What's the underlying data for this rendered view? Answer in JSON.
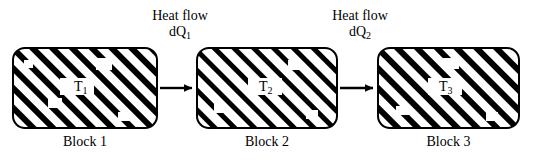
{
  "figure": {
    "type": "diagram",
    "background_color": "#ffffff",
    "stroke_color": "#000000"
  },
  "blocks": [
    {
      "id": "block1",
      "caption": "Block 1",
      "temperature_label": "T",
      "temperature_subscript": "1",
      "fill": "diagonal-hatch",
      "x": 13,
      "y": 48,
      "width": 144,
      "height": 80,
      "radius": 12
    },
    {
      "id": "block2",
      "caption": "Block 2",
      "temperature_label": "T",
      "temperature_subscript": "2",
      "fill": "diagonal-hatch",
      "x": 197,
      "y": 48,
      "width": 140,
      "height": 80,
      "radius": 12
    },
    {
      "id": "block3",
      "caption": "Block 3",
      "temperature_label": "T",
      "temperature_subscript": "3",
      "fill": "diagonal-hatch",
      "x": 378,
      "y": 48,
      "width": 141,
      "height": 80,
      "radius": 12
    }
  ],
  "arrows": [
    {
      "id": "arrow1",
      "from_block": "block1",
      "to_block": "block2",
      "label_line1": "Heat flow",
      "label_line2_prefix": "dQ",
      "label_line2_subscript": "1",
      "x1": 160,
      "x2": 196,
      "y": 88
    },
    {
      "id": "arrow2",
      "from_block": "block2",
      "to_block": "block3",
      "label_line1": "Heat flow",
      "label_line2_prefix": "dQ",
      "label_line2_subscript": "2",
      "x1": 340,
      "x2": 377,
      "y": 88
    }
  ],
  "colors": {
    "stroke": "#000000",
    "background": "#ffffff",
    "hatch": "#000000"
  }
}
